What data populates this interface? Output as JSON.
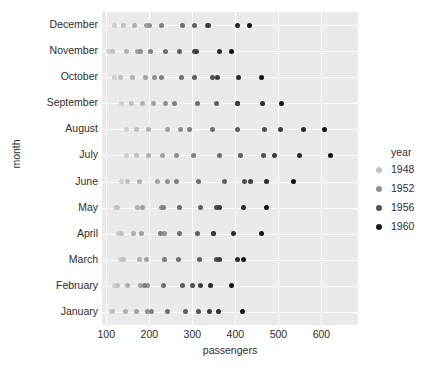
{
  "chart_data": {
    "type": "scatter",
    "title": "",
    "xlabel": "passengers",
    "ylabel": "month",
    "xlim": [
      90,
      685
    ],
    "xticks": [
      100,
      200,
      300,
      400,
      500,
      600
    ],
    "xtick_labels": [
      "100",
      "200",
      "300",
      "400",
      "500",
      "600"
    ],
    "grid": true,
    "categories": [
      "January",
      "February",
      "March",
      "April",
      "May",
      "June",
      "July",
      "August",
      "September",
      "October",
      "November",
      "December"
    ],
    "category_order_top_to_bottom": [
      "December",
      "November",
      "October",
      "September",
      "August",
      "July",
      "June",
      "May",
      "April",
      "March",
      "February",
      "January"
    ],
    "legend": {
      "title": "year",
      "position": "right",
      "entries": [
        {
          "label": "1948",
          "color": "#c2c2c2"
        },
        {
          "label": "1952",
          "color": "#8e8e8e"
        },
        {
          "label": "1956",
          "color": "#545454"
        },
        {
          "label": "1960",
          "color": "#1a1a1a"
        }
      ]
    },
    "hue": "year",
    "hue_values": [
      1949,
      1950,
      1951,
      1952,
      1953,
      1954,
      1955,
      1956,
      1957,
      1958,
      1959,
      1960
    ],
    "hue_colors": [
      "#cfcfcf",
      "#c0c0c0",
      "#b0b0b0",
      "#a0a0a0",
      "#909090",
      "#808080",
      "#6f6f6f",
      "#5f5f5f",
      "#4f4f4f",
      "#3d3d3d",
      "#2b2b2b",
      "#131313"
    ],
    "series": [
      {
        "name": "1949",
        "color": "#cfcfcf",
        "values": [
          112,
          118,
          132,
          129,
          121,
          135,
          148,
          148,
          136,
          119,
          104,
          118
        ]
      },
      {
        "name": "1950",
        "color": "#c0c0c0",
        "values": [
          115,
          126,
          141,
          135,
          125,
          149,
          170,
          170,
          158,
          133,
          114,
          140
        ]
      },
      {
        "name": "1951",
        "color": "#b0b0b0",
        "values": [
          145,
          150,
          178,
          163,
          172,
          178,
          199,
          199,
          184,
          162,
          146,
          166
        ]
      },
      {
        "name": "1952",
        "color": "#a0a0a0",
        "values": [
          171,
          180,
          193,
          181,
          183,
          218,
          230,
          242,
          209,
          191,
          172,
          194
        ]
      },
      {
        "name": "1953",
        "color": "#909090",
        "values": [
          196,
          196,
          236,
          235,
          229,
          243,
          264,
          272,
          237,
          211,
          180,
          201
        ]
      },
      {
        "name": "1954",
        "color": "#808080",
        "values": [
          204,
          188,
          235,
          227,
          234,
          264,
          302,
          293,
          259,
          229,
          203,
          229
        ]
      },
      {
        "name": "1955",
        "color": "#6f6f6f",
        "values": [
          242,
          233,
          267,
          269,
          270,
          315,
          364,
          347,
          312,
          274,
          237,
          278
        ]
      },
      {
        "name": "1956",
        "color": "#5f5f5f",
        "values": [
          284,
          277,
          317,
          313,
          318,
          374,
          413,
          405,
          355,
          306,
          271,
          306
        ]
      },
      {
        "name": "1957",
        "color": "#4f4f4f",
        "values": [
          315,
          301,
          356,
          348,
          355,
          422,
          465,
          467,
          404,
          347,
          305,
          336
        ]
      },
      {
        "name": "1958",
        "color": "#3d3d3d",
        "values": [
          340,
          318,
          362,
          348,
          363,
          435,
          491,
          505,
          404,
          359,
          310,
          337
        ]
      },
      {
        "name": "1959",
        "color": "#2b2b2b",
        "values": [
          360,
          342,
          406,
          396,
          420,
          472,
          548,
          559,
          463,
          407,
          362,
          405
        ]
      },
      {
        "name": "1960",
        "color": "#131313",
        "values": [
          417,
          391,
          419,
          461,
          472,
          535,
          622,
          606,
          508,
          461,
          390,
          432
        ]
      }
    ]
  },
  "axes": {
    "x_label": "passengers",
    "y_label": "month"
  },
  "legend": {
    "title": "year",
    "items": [
      "1948",
      "1952",
      "1956",
      "1960"
    ]
  }
}
